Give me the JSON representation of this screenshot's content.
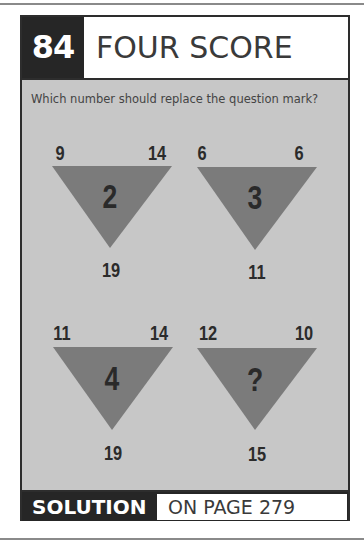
{
  "puzzle": {
    "number": "84",
    "title": "FOUR SCORE",
    "question": "Which number should replace the question mark?",
    "triangles": [
      {
        "top_left": "9",
        "top_right": "14",
        "bottom": "19",
        "center": "2"
      },
      {
        "top_left": "6",
        "top_right": "6",
        "bottom": "11",
        "center": "3"
      },
      {
        "top_left": "11",
        "top_right": "14",
        "bottom": "19",
        "center": "4"
      },
      {
        "top_left": "12",
        "top_right": "10",
        "bottom": "15",
        "center": "?"
      }
    ]
  },
  "footer": {
    "solution_label": "SOLUTION",
    "page_ref": "ON PAGE 279"
  },
  "colors": {
    "panel_bg": "#c7c7c7",
    "triangle": "#7b7b7b",
    "header_dark": "#262626"
  }
}
